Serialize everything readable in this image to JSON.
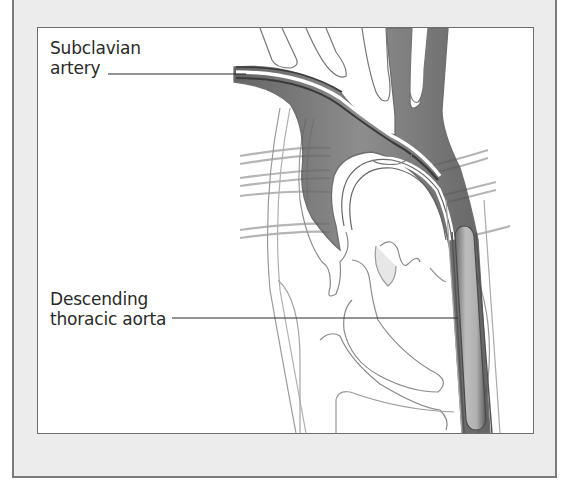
{
  "figure": {
    "labels": [
      {
        "id": "subclavian",
        "line1": "Subclavian",
        "line2": "artery",
        "leader_to": "left subclavian artery"
      },
      {
        "id": "descending",
        "line1": "Descending",
        "line2": "thoracic aorta",
        "leader_to": "descending thoracic aorta"
      }
    ],
    "colors": {
      "frame_border": "#7a7a7a",
      "frame_fill": "#ececec",
      "panel_fill": "#ffffff",
      "vessel_dark": "#5a5a5a",
      "vessel_mid": "#9a9a9a",
      "vessel_light": "#c8c8c8",
      "outline": "#8c8c8c",
      "text": "#2a2a2a"
    }
  }
}
